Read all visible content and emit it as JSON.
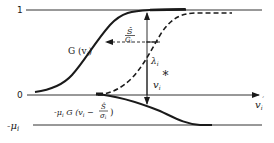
{
  "diagram": {
    "levels": {
      "one": "1",
      "zero": "0",
      "neg_mu": "-μ",
      "neg_mu_sub": "i"
    },
    "axis": {
      "x_label": "v",
      "x_label_sub": "i",
      "x_label_sup": "ˊ"
    },
    "curves": {
      "upper_solid": {
        "label": "G (v",
        "label_sub": "i",
        "label_close": ")",
        "style": "solid"
      },
      "upper_dashed": {
        "style": "dashed"
      },
      "lower_solid": {
        "label": "-μ",
        "label_sub": "i",
        "label_rest": " G (v",
        "label_rest_sub": "i",
        "label_minus": " − ",
        "label_frac_num": "Ŝ",
        "label_frac_den": "σ",
        "label_frac_den_sub": "i",
        "label_close": ")",
        "style": "solid"
      }
    },
    "annotations": {
      "shift": {
        "num": "Ŝ",
        "den": "G",
        "den_sub": "i"
      },
      "lambda": {
        "symbol": "λ",
        "sub": "i"
      },
      "v_star": {
        "symbol": "v",
        "sub": "i",
        "sup": "*"
      }
    },
    "colors": {
      "ink": "#1a1a1a",
      "background": "#ffffff"
    }
  }
}
